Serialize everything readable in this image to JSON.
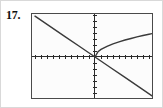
{
  "page": {
    "width": 163,
    "height": 108,
    "background_color": "#ffffff",
    "border_color": "#d9d9d9"
  },
  "problem": {
    "number_label": "17."
  },
  "plot": {
    "frame": {
      "x": 30,
      "y": 12,
      "width": 122,
      "height": 86,
      "border_color": "#4a4a4a",
      "fill_color": "#fcfcfc"
    },
    "origin": {
      "x": 63,
      "y": 43
    },
    "axis_color": "#2b2b2b",
    "curve_color": "#3a3a3a",
    "tick_spacing": 6,
    "tick_length": 4
  },
  "chart_data": {
    "type": "line",
    "title": "",
    "xlabel": "",
    "ylabel": "",
    "xlim": [
      -10,
      10
    ],
    "ylim": [
      -7.2,
      7.2
    ],
    "grid": false,
    "legend": null,
    "axes": {
      "x_axis_visible": true,
      "y_axis_visible": true,
      "x_axis_y_value": 0,
      "y_axis_x_value": 0,
      "tick_interval_x": 1,
      "tick_interval_y": 1,
      "tick_labels_shown": false
    },
    "series": [
      {
        "name": "decreasing-line",
        "type": "line",
        "description": "straight line with negative slope through the origin",
        "equation": "y = -0.7x",
        "x": [
          -10,
          -7.5,
          -5,
          -2.5,
          0,
          2.5,
          5,
          7.5,
          10
        ],
        "values": [
          7.0,
          5.25,
          3.5,
          1.75,
          0,
          -1.75,
          -3.5,
          -5.25,
          -7.0
        ]
      },
      {
        "name": "square-root-curve",
        "type": "line",
        "description": "square root curve starting at the origin, rising to the right",
        "equation": "y = 1.3*sqrt(x)",
        "x": [
          0,
          0.5,
          1,
          2,
          3,
          4,
          5,
          6,
          7,
          8,
          9,
          10
        ],
        "values": [
          0,
          0.92,
          1.3,
          1.84,
          2.25,
          2.6,
          2.91,
          3.18,
          3.44,
          3.68,
          3.9,
          4.11
        ]
      }
    ]
  }
}
